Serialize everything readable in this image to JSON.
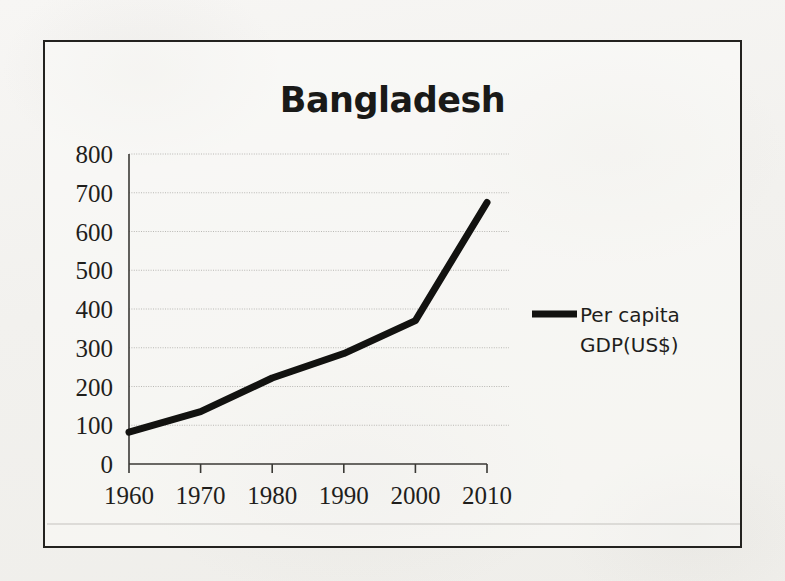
{
  "chart_data": {
    "type": "line",
    "title": "Bangladesh",
    "xlabel": "",
    "ylabel": "",
    "x": [
      1960,
      1970,
      1980,
      1990,
      2000,
      2010
    ],
    "categories": [
      "1960",
      "1970",
      "1980",
      "1990",
      "2000",
      "2010"
    ],
    "series": [
      {
        "name": "Per capita GDP(US$)",
        "values": [
          82,
          135,
          222,
          285,
          370,
          675
        ],
        "color": "#121210"
      }
    ],
    "xlim": [
      1960,
      2010
    ],
    "ylim": [
      0,
      800
    ],
    "ytick_labels": [
      "800",
      "700",
      "600",
      "500",
      "400",
      "300",
      "200",
      "100",
      "0"
    ],
    "ytick_values": [
      800,
      700,
      600,
      500,
      400,
      300,
      200,
      100,
      0
    ],
    "xtick_labels": [
      "1960",
      "1970",
      "1980",
      "1990",
      "2000",
      "2010"
    ],
    "grid": "horizontal-dotted",
    "legend_position": "right",
    "legend_entries": [
      {
        "line1": "Per capita",
        "line2": "GDP(US$)",
        "full": "Per capita GDP(US$)"
      }
    ]
  },
  "frame": {
    "border_color": "#23221f",
    "background_color": "#f4f3f1"
  }
}
